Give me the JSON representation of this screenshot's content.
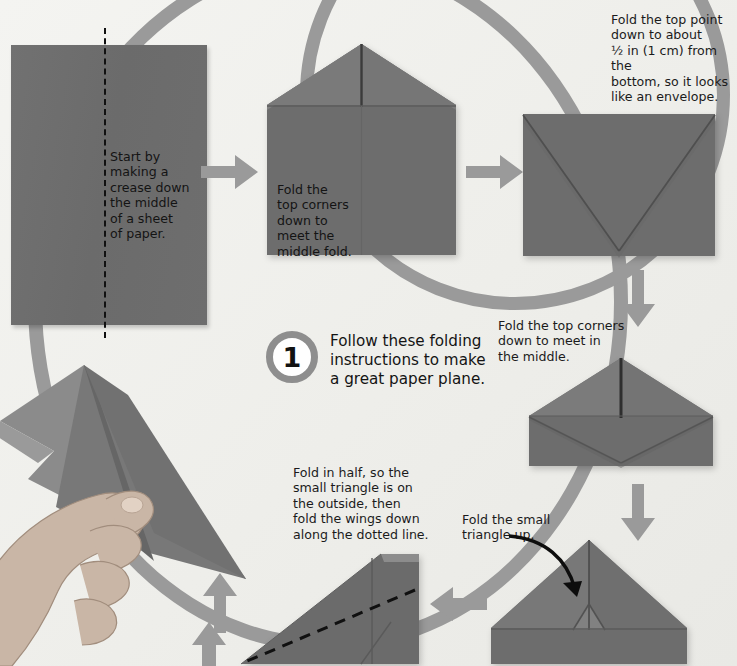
{
  "page": {
    "step_number": "1",
    "headline": "Follow these folding\ninstructions to make\na great paper plane."
  },
  "colors": {
    "background": "#f2f2ef",
    "paper_gray": "#6e6e6e",
    "paper_gray_light": "#8a8a8a",
    "arrow_gray": "#9a9a9a",
    "ring_gray": "#9a9a9a",
    "text": "#141414",
    "crease_line": "#111111"
  },
  "steps": [
    {
      "id": "step-1-crease",
      "caption": "Start by\nmaking a\ncrease down\nthe middle\nof a sheet\nof paper.",
      "shape": "flat-sheet-with-vertical-dashed-crease"
    },
    {
      "id": "step-2-top-corners",
      "caption": "Fold the\ntop corners\ndown to\nmeet the\nmiddle fold.",
      "shape": "house-with-peak"
    },
    {
      "id": "step-3-envelope",
      "caption": "Fold the top point\ndown to about\n½ in (1 cm) from the\nbottom, so it looks\nlike an envelope.",
      "shape": "envelope-rectangle-with-v-crease"
    },
    {
      "id": "step-4-corners-middle",
      "caption": "Fold the top corners\ndown to meet in\nthe middle.",
      "shape": "peak-over-trapezoid"
    },
    {
      "id": "step-5-small-triangle",
      "caption": "Fold the small\ntriangle up.",
      "shape": "large-triangle-with-small-flap"
    },
    {
      "id": "step-6-fold-half",
      "caption": "Fold in half, so the\nsmall triangle is on\nthe outside, then\nfold the wings down\nalong the dotted line.",
      "shape": "half-folded-plane-with-diagonal-dashed-line"
    }
  ],
  "arrows": [
    {
      "id": "arrow-1-to-2",
      "direction": "right"
    },
    {
      "id": "arrow-2-to-3",
      "direction": "right"
    },
    {
      "id": "arrow-3-to-4",
      "direction": "down"
    },
    {
      "id": "arrow-4-to-5",
      "direction": "down"
    },
    {
      "id": "arrow-5-to-6",
      "direction": "left"
    },
    {
      "id": "arrow-6-to-finished",
      "direction": "up"
    },
    {
      "id": "arrow-finished-plane",
      "direction": "up"
    },
    {
      "id": "arrow-callout-small-triangle",
      "direction": "curved-down-right"
    }
  ],
  "photo": {
    "hand_plane_alt": "hand holding finished paper plane"
  }
}
